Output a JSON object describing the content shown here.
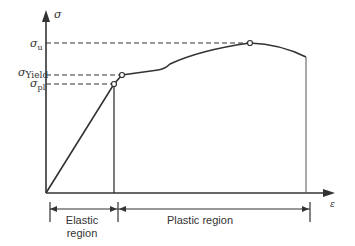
{
  "diagram": {
    "axes": {
      "y_label": "σ",
      "x_label": "ε"
    },
    "stress_labels": {
      "ultimate": {
        "symbol": "σ",
        "subscript": "u"
      },
      "yield": {
        "symbol": "σ",
        "subscript": "Yield"
      },
      "proportional_limit": {
        "symbol": "σ",
        "subscript": "pl"
      }
    },
    "regions": {
      "elastic_line1": "Elastic",
      "elastic_line2": "region",
      "plastic": "Plastic region"
    },
    "colors": {
      "line": "#333333",
      "background": "#ffffff"
    }
  }
}
